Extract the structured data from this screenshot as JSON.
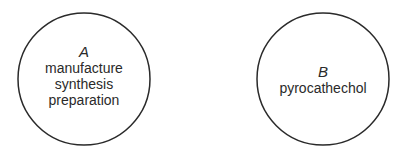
{
  "diagram": {
    "circles": [
      {
        "id": "A",
        "letter": "A",
        "lines": [
          "manufacture",
          "synthesis",
          "preparation"
        ],
        "cx": 84,
        "cy": 79,
        "r": 66
      },
      {
        "id": "B",
        "letter": "B",
        "lines": [
          "pyrocathechol"
        ],
        "cx": 323,
        "cy": 79,
        "r": 66
      }
    ],
    "stroke_color": "#2a2a2a"
  }
}
